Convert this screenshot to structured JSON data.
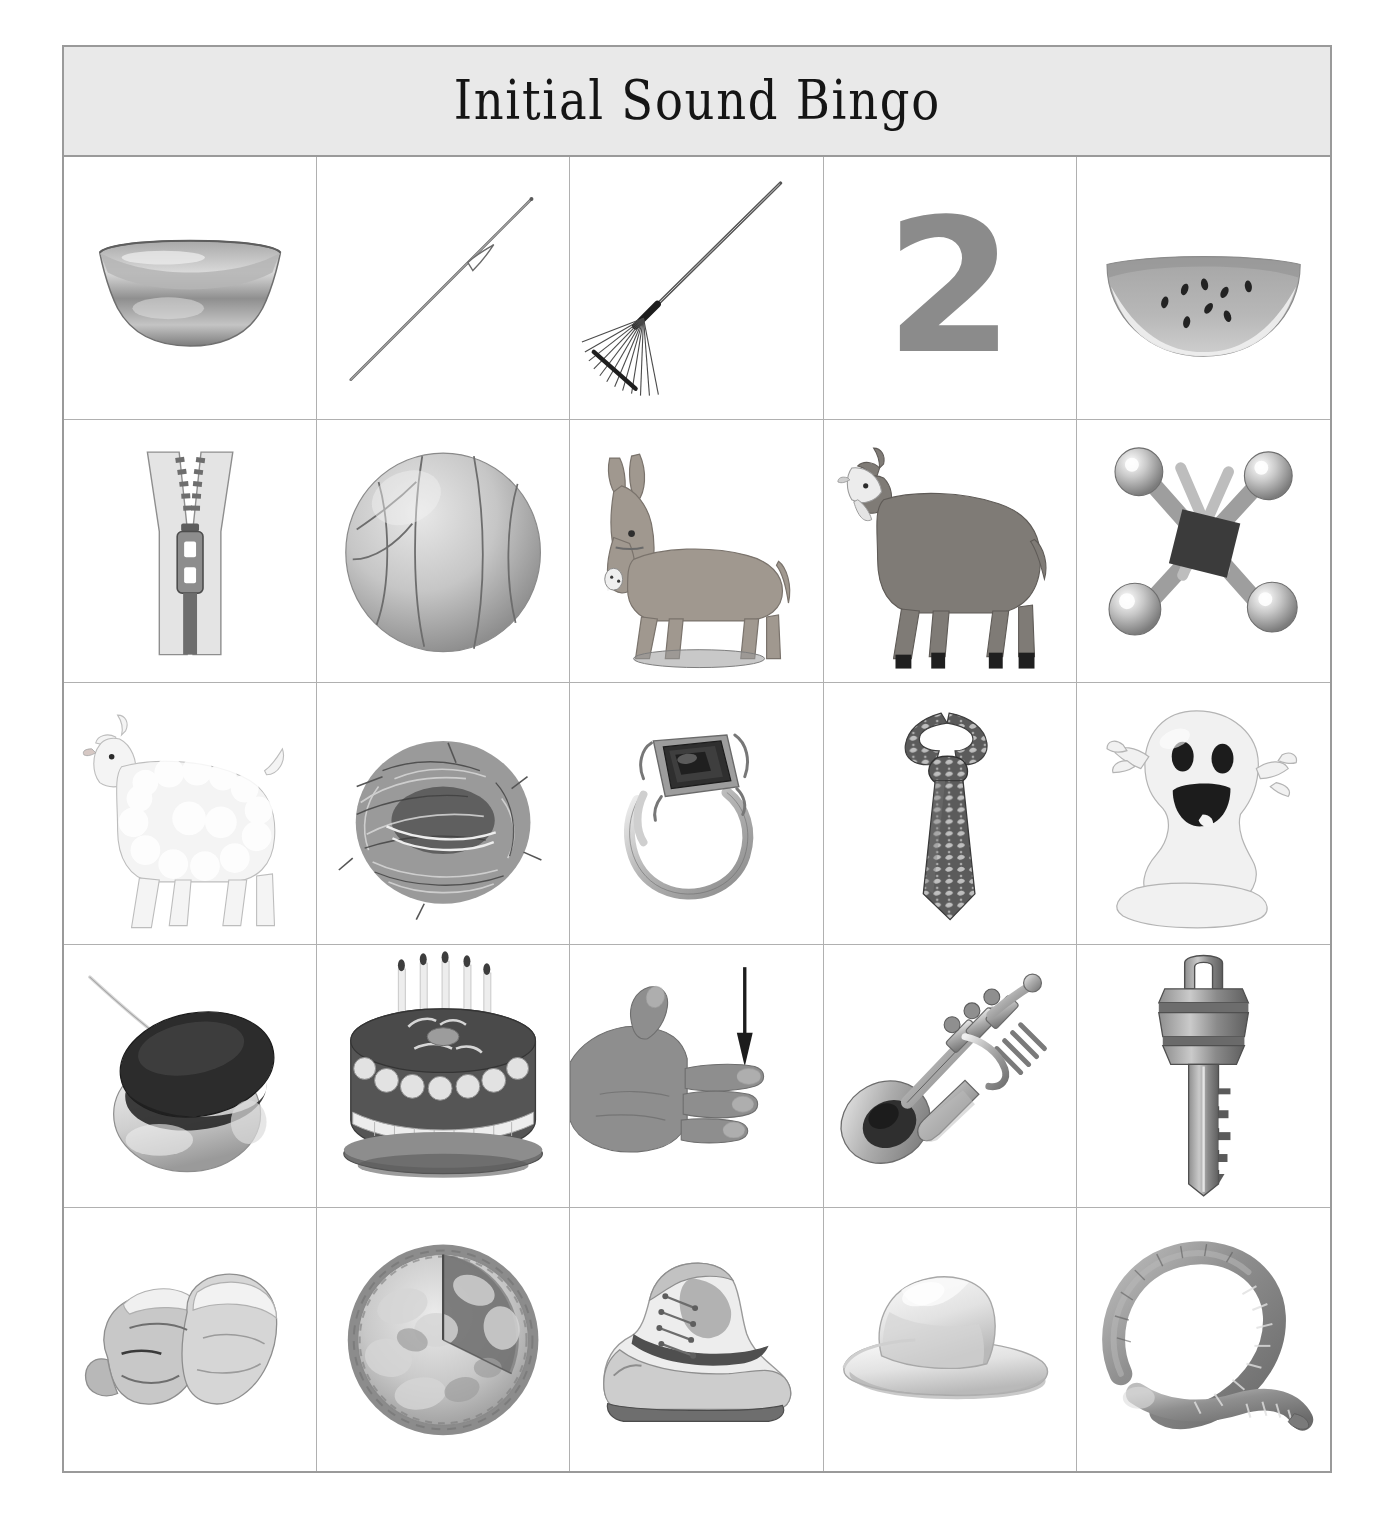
{
  "page": {
    "background_color": "#ffffff",
    "card_border_color": "#9a9a9a",
    "grid_line_color": "#b0b0b0"
  },
  "header": {
    "title": "Initial Sound Bingo",
    "background_color": "#e9e9e9",
    "text_color": "#151515"
  },
  "grid": {
    "columns": 5,
    "rows": 5,
    "cells": [
      {
        "index": 1,
        "row": 1,
        "col": 1,
        "picture": "bowl",
        "label": "bowl",
        "initial_sound": "b",
        "art": "bowl-icon"
      },
      {
        "index": 2,
        "row": 1,
        "col": 2,
        "picture": "needle",
        "label": "needle",
        "initial_sound": "n",
        "art": "needle-icon"
      },
      {
        "index": 3,
        "row": 1,
        "col": 3,
        "picture": "rake",
        "label": "rake",
        "initial_sound": "r",
        "art": "rake-icon"
      },
      {
        "index": 4,
        "row": 1,
        "col": 4,
        "picture": "two",
        "label": "2",
        "initial_sound": "t",
        "art": "numeral-two"
      },
      {
        "index": 5,
        "row": 1,
        "col": 5,
        "picture": "watermelon",
        "label": "watermelon",
        "initial_sound": "w",
        "art": "watermelon-icon"
      },
      {
        "index": 6,
        "row": 2,
        "col": 1,
        "picture": "zipper",
        "label": "zipper",
        "initial_sound": "z",
        "art": "zipper-icon"
      },
      {
        "index": 7,
        "row": 2,
        "col": 2,
        "picture": "ball",
        "label": "ball",
        "initial_sound": "b",
        "art": "ball-icon"
      },
      {
        "index": 8,
        "row": 2,
        "col": 3,
        "picture": "donkey",
        "label": "donkey",
        "initial_sound": "d",
        "art": "donkey-icon"
      },
      {
        "index": 9,
        "row": 2,
        "col": 4,
        "picture": "goat",
        "label": "goat",
        "initial_sound": "g",
        "art": "goat-icon"
      },
      {
        "index": 10,
        "row": 2,
        "col": 5,
        "picture": "jacks",
        "label": "jacks",
        "initial_sound": "j",
        "art": "jacks-icon"
      },
      {
        "index": 11,
        "row": 3,
        "col": 1,
        "picture": "lamb",
        "label": "lamb",
        "initial_sound": "l",
        "art": "lamb-icon"
      },
      {
        "index": 12,
        "row": 3,
        "col": 2,
        "picture": "nest",
        "label": "nest",
        "initial_sound": "n",
        "art": "nest-icon"
      },
      {
        "index": 13,
        "row": 3,
        "col": 3,
        "picture": "ring",
        "label": "ring",
        "initial_sound": "r",
        "art": "ring-icon"
      },
      {
        "index": 14,
        "row": 3,
        "col": 4,
        "picture": "tie",
        "label": "tie",
        "initial_sound": "t",
        "art": "tie-icon"
      },
      {
        "index": 15,
        "row": 3,
        "col": 5,
        "picture": "ghost",
        "label": "ghost",
        "initial_sound": "g",
        "art": "ghost-icon"
      },
      {
        "index": 16,
        "row": 4,
        "col": 1,
        "picture": "yoyo",
        "label": "yo-yo",
        "initial_sound": "y",
        "art": "yoyo-icon"
      },
      {
        "index": 17,
        "row": 4,
        "col": 2,
        "picture": "cake",
        "label": "cake",
        "initial_sound": "k",
        "art": "cake-icon",
        "cake_text": "Happy Birthday"
      },
      {
        "index": 18,
        "row": 4,
        "col": 3,
        "picture": "finger",
        "label": "finger",
        "initial_sound": "f",
        "art": "hand-finger-icon"
      },
      {
        "index": 19,
        "row": 4,
        "col": 4,
        "picture": "trumpet",
        "label": "trumpet",
        "initial_sound": "tr",
        "art": "trumpet-icon"
      },
      {
        "index": 20,
        "row": 4,
        "col": 5,
        "picture": "key",
        "label": "key",
        "initial_sound": "k",
        "art": "key-icon"
      },
      {
        "index": 21,
        "row": 5,
        "col": 1,
        "picture": "mittens",
        "label": "mittens",
        "initial_sound": "m",
        "art": "mittens-icon"
      },
      {
        "index": 22,
        "row": 5,
        "col": 2,
        "picture": "pie",
        "label": "pie",
        "initial_sound": "p",
        "art": "pie-icon"
      },
      {
        "index": 23,
        "row": 5,
        "col": 3,
        "picture": "shoe",
        "label": "shoe",
        "initial_sound": "sh",
        "art": "shoe-icon"
      },
      {
        "index": 24,
        "row": 5,
        "col": 4,
        "picture": "hat",
        "label": "hat",
        "initial_sound": "h",
        "art": "hat-icon"
      },
      {
        "index": 25,
        "row": 5,
        "col": 5,
        "picture": "worm",
        "label": "worm",
        "initial_sound": "w",
        "art": "worm-icon"
      }
    ]
  }
}
